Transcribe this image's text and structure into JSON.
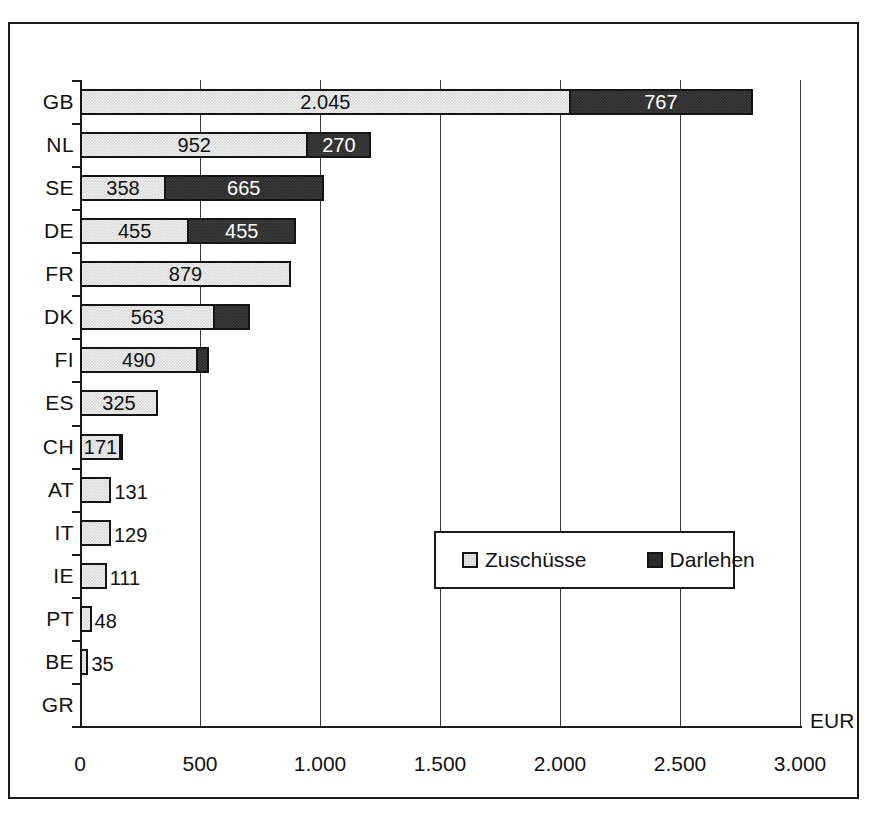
{
  "chart_data": {
    "type": "bar",
    "orientation": "horizontal",
    "stacked": true,
    "title": "",
    "xlabel": "EUR",
    "ylabel": "",
    "xlim": [
      0,
      3000
    ],
    "xticks": [
      "0",
      "500",
      "1.000",
      "1.500",
      "2.000",
      "2.500",
      "3.000"
    ],
    "xtick_values": [
      0,
      500,
      1000,
      1500,
      2000,
      2500,
      3000
    ],
    "grid": true,
    "legend_position": "center-right-inside",
    "categories": [
      "GB",
      "NL",
      "SE",
      "DE",
      "FR",
      "DK",
      "FI",
      "ES",
      "CH",
      "AT",
      "IT",
      "IE",
      "PT",
      "BE",
      "GR"
    ],
    "series": [
      {
        "name": "Zuschüsse",
        "color": "#d6d6d6",
        "values": [
          2045,
          952,
          358,
          455,
          879,
          563,
          490,
          325,
          171,
          131,
          129,
          111,
          48,
          35,
          0
        ]
      },
      {
        "name": "Darlehen",
        "color": "#2b2b2b",
        "values": [
          767,
          270,
          665,
          455,
          0,
          155,
          55,
          0,
          15,
          0,
          0,
          0,
          0,
          0,
          0
        ]
      }
    ],
    "rows": [
      {
        "category": "GB",
        "light_value": 2045,
        "light_label": "2.045",
        "light_label_inside": true,
        "dark_value": 767,
        "dark_label": "767",
        "dark_label_inside": true
      },
      {
        "category": "NL",
        "light_value": 952,
        "light_label": "952",
        "light_label_inside": true,
        "dark_value": 270,
        "dark_label": "270",
        "dark_label_inside": true
      },
      {
        "category": "SE",
        "light_value": 358,
        "light_label": "358",
        "light_label_inside": true,
        "dark_value": 665,
        "dark_label": "665",
        "dark_label_inside": true
      },
      {
        "category": "DE",
        "light_value": 455,
        "light_label": "455",
        "light_label_inside": true,
        "dark_value": 455,
        "dark_label": "455",
        "dark_label_inside": true
      },
      {
        "category": "FR",
        "light_value": 879,
        "light_label": "879",
        "light_label_inside": true,
        "dark_value": 0,
        "dark_label": "",
        "dark_label_inside": true
      },
      {
        "category": "DK",
        "light_value": 563,
        "light_label": "563",
        "light_label_inside": true,
        "dark_value": 155,
        "dark_label": "",
        "dark_label_inside": true
      },
      {
        "category": "FI",
        "light_value": 490,
        "light_label": "490",
        "light_label_inside": true,
        "dark_value": 55,
        "dark_label": "",
        "dark_label_inside": true
      },
      {
        "category": "ES",
        "light_value": 325,
        "light_label": "325",
        "light_label_inside": true,
        "dark_value": 0,
        "dark_label": "",
        "dark_label_inside": true
      },
      {
        "category": "CH",
        "light_value": 171,
        "light_label": "171",
        "light_label_inside": true,
        "dark_value": 15,
        "dark_label": "",
        "dark_label_inside": true
      },
      {
        "category": "AT",
        "light_value": 131,
        "light_label": "131",
        "light_label_inside": false,
        "dark_value": 0,
        "dark_label": "",
        "dark_label_inside": true
      },
      {
        "category": "IT",
        "light_value": 129,
        "light_label": "129",
        "light_label_inside": false,
        "dark_value": 0,
        "dark_label": "",
        "dark_label_inside": true
      },
      {
        "category": "IE",
        "light_value": 111,
        "light_label": "111",
        "light_label_inside": false,
        "dark_value": 0,
        "dark_label": "",
        "dark_label_inside": true
      },
      {
        "category": "PT",
        "light_value": 48,
        "light_label": "48",
        "light_label_inside": false,
        "dark_value": 0,
        "dark_label": "",
        "dark_label_inside": true
      },
      {
        "category": "BE",
        "light_value": 35,
        "light_label": "35",
        "light_label_inside": false,
        "dark_value": 0,
        "dark_label": "",
        "dark_label_inside": true
      },
      {
        "category": "GR",
        "light_value": 0,
        "light_label": "",
        "light_label_inside": false,
        "dark_value": 0,
        "dark_label": "",
        "dark_label_inside": true
      }
    ],
    "legend": [
      {
        "label": "Zuschüsse",
        "swatch": "light"
      },
      {
        "label": "Darlehen",
        "swatch": "dark"
      }
    ]
  }
}
